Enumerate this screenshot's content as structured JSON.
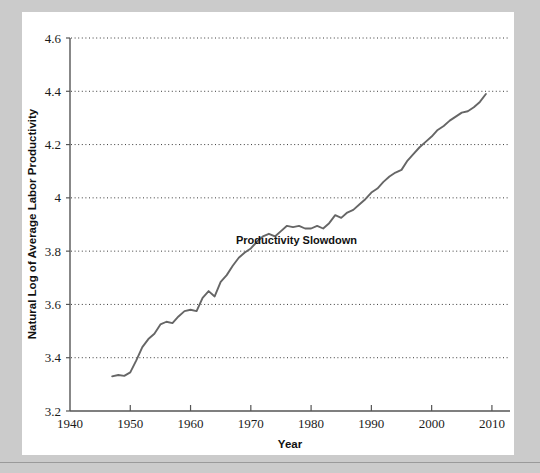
{
  "figure": {
    "background_color": "#cbcbcb",
    "panel_color": "#ffffff"
  },
  "chart_data": {
    "type": "line",
    "title": "",
    "xlabel": "Year",
    "ylabel": "Natural Log of Average Labor Productivity",
    "xlim": [
      1940,
      2013
    ],
    "ylim": [
      3.2,
      4.6
    ],
    "xticks": [
      1940,
      1950,
      1960,
      1970,
      1980,
      1990,
      2000,
      2010
    ],
    "xtick_labels": [
      "1940",
      "1950",
      "1960",
      "1970",
      "1980",
      "1990",
      "2000",
      "2010"
    ],
    "yticks": [
      3.2,
      3.4,
      3.6,
      3.8,
      4,
      4.2,
      4.4,
      4.6
    ],
    "ytick_labels": [
      "3.2",
      "3.4",
      "3.6",
      "3.8",
      "4",
      "4.2",
      "4.4",
      "4.6"
    ],
    "grid": "horizontal-dotted",
    "legend": "none",
    "line_color": "#666666",
    "line_width": 2,
    "annotations": [
      {
        "text": "Productivity Slowdown",
        "x": 1971.5,
        "y": 3.815,
        "bold": true
      }
    ],
    "series": [
      {
        "name": "Natural Log of Average Labor Productivity",
        "x": [
          1947,
          1948,
          1949,
          1950,
          1951,
          1952,
          1953,
          1954,
          1955,
          1956,
          1957,
          1958,
          1959,
          1960,
          1961,
          1962,
          1963,
          1964,
          1965,
          1966,
          1967,
          1968,
          1969,
          1970,
          1971,
          1972,
          1973,
          1974,
          1975,
          1976,
          1977,
          1978,
          1979,
          1980,
          1981,
          1982,
          1983,
          1984,
          1985,
          1986,
          1987,
          1988,
          1989,
          1990,
          1991,
          1992,
          1993,
          1994,
          1995,
          1996,
          1997,
          1998,
          1999,
          2000,
          2001,
          2002,
          2003,
          2004,
          2005,
          2006,
          2007,
          2008,
          2009
        ],
        "values": [
          3.33,
          3.335,
          3.332,
          3.345,
          3.39,
          3.44,
          3.47,
          3.49,
          3.525,
          3.535,
          3.53,
          3.555,
          3.575,
          3.58,
          3.575,
          3.625,
          3.65,
          3.63,
          3.685,
          3.71,
          3.745,
          3.775,
          3.795,
          3.81,
          3.835,
          3.855,
          3.865,
          3.855,
          3.875,
          3.895,
          3.89,
          3.895,
          3.885,
          3.885,
          3.895,
          3.885,
          3.905,
          3.935,
          3.925,
          3.945,
          3.955,
          3.975,
          3.995,
          4.02,
          4.035,
          4.06,
          4.08,
          4.095,
          4.105,
          4.14,
          4.165,
          4.19,
          4.21,
          4.23,
          4.255,
          4.27,
          4.29,
          4.305,
          4.32,
          4.325,
          4.34,
          4.36,
          4.39
        ]
      }
    ]
  },
  "axis": {
    "x_title": "Year",
    "y_title": "Natural Log of Average Labor Productivity"
  }
}
